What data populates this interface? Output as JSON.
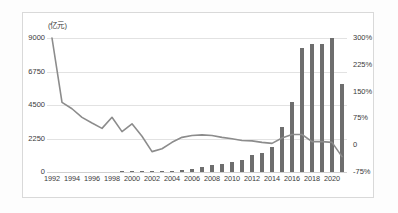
{
  "axis_title": "(亿元)",
  "left_axis": {
    "ticks": [
      "9000",
      "6750",
      "4500",
      "2250",
      "0"
    ],
    "values": [
      9000,
      6750,
      4500,
      2250,
      0
    ]
  },
  "right_axis": {
    "ticks": [
      "300%",
      "225%",
      "150%",
      "75%",
      "0",
      "-75%"
    ],
    "values": [
      300,
      225,
      150,
      75,
      0,
      -75
    ]
  },
  "x_tick_labels": [
    "1992",
    "1994",
    "1996",
    "1998",
    "2000",
    "2002",
    "2004",
    "2006",
    "2008",
    "2010",
    "2012",
    "2014",
    "2016",
    "2018",
    "2020"
  ],
  "colors": {
    "bar": "#6e6e6e",
    "line": "#8c8c8c",
    "grid": "#e2e2e2",
    "text": "#3a3a3a",
    "frame": "#d9d9d9"
  },
  "chart_data": {
    "type": "bar",
    "title": "",
    "subtitle": "",
    "xlabel": "",
    "ylabel": "(亿元)",
    "y2label": "",
    "grid": true,
    "legend_position": "none",
    "ylim": [
      0,
      9000
    ],
    "y2lim": [
      -75,
      300
    ],
    "categories": [
      "1992",
      "1993",
      "1994",
      "1995",
      "1996",
      "1997",
      "1998",
      "1999",
      "2000",
      "2001",
      "2002",
      "2003",
      "2004",
      "2005",
      "2006",
      "2007",
      "2008",
      "2009",
      "2010",
      "2011",
      "2012",
      "2013",
      "2014",
      "2015",
      "2016",
      "2017",
      "2018",
      "2019",
      "2020",
      "2021"
    ],
    "series": [
      {
        "name": "规模(亿元)",
        "type": "bar",
        "axis": "left",
        "values": [
          0,
          0,
          0,
          0,
          0,
          0,
          0,
          30,
          60,
          70,
          70,
          80,
          90,
          120,
          200,
          330,
          480,
          560,
          700,
          780,
          1160,
          1250,
          1700,
          3000,
          4700,
          8300,
          8600,
          8600,
          9000,
          5900
        ]
      },
      {
        "name": "增长率(%)",
        "type": "line",
        "axis": "right",
        "values": [
          300,
          120,
          102,
          78,
          62,
          47,
          78,
          38,
          60,
          25,
          -18,
          -10,
          8,
          22,
          27,
          29,
          27,
          22,
          18,
          13,
          12,
          8,
          5,
          20,
          30,
          30,
          10,
          10,
          8,
          -32
        ]
      }
    ]
  }
}
